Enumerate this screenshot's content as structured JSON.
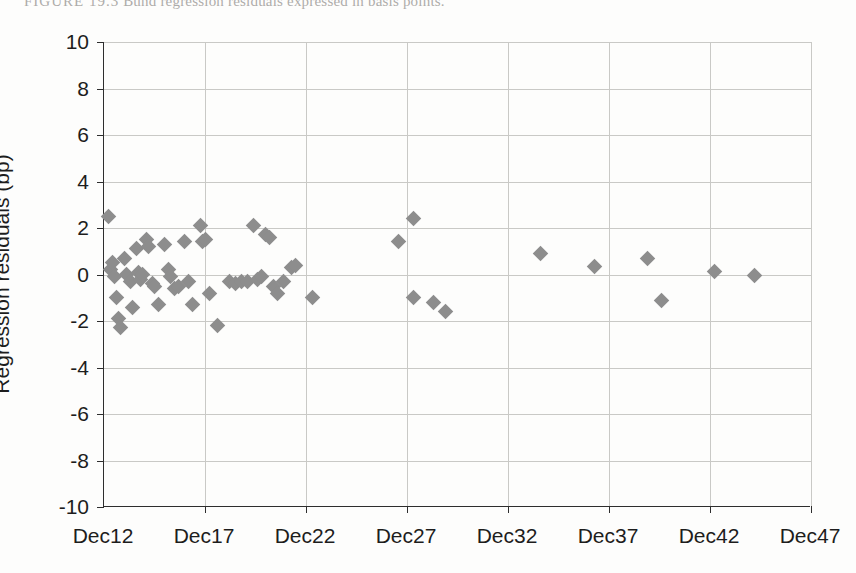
{
  "caption": {
    "label": "FIGURE 19.3",
    "text": "Bund regression residuals expressed in basis points."
  },
  "chart_data": {
    "type": "scatter",
    "title": "",
    "xlabel": "",
    "ylabel": "Regression residuals (bp)",
    "xlim": [
      2012,
      2047
    ],
    "ylim": [
      -10,
      10
    ],
    "grid": true,
    "legend": "none",
    "marker": {
      "shape": "diamond",
      "color": "#8d8d8d",
      "size": 11
    },
    "xtick_labels": [
      "Dec12",
      "Dec17",
      "Dec22",
      "Dec27",
      "Dec32",
      "Dec37",
      "Dec42",
      "Dec47"
    ],
    "xtick_values": [
      2012,
      2017,
      2022,
      2027,
      2032,
      2037,
      2042,
      2047
    ],
    "ytick_labels": [
      "10",
      "8",
      "6",
      "4",
      "2",
      "0",
      "-2",
      "-4",
      "-6",
      "-8",
      "-10"
    ],
    "ytick_values": [
      10,
      8,
      6,
      4,
      2,
      0,
      -2,
      -4,
      -6,
      -8,
      -10
    ],
    "series": [
      {
        "name": "Bund regression residuals",
        "points": [
          [
            2012.2,
            2.5
          ],
          [
            2012.3,
            0.2
          ],
          [
            2012.4,
            0.5
          ],
          [
            2012.5,
            -0.1
          ],
          [
            2012.6,
            -1.0
          ],
          [
            2012.7,
            -1.9
          ],
          [
            2012.8,
            -2.3
          ],
          [
            2013.0,
            0.7
          ],
          [
            2013.1,
            0.0
          ],
          [
            2013.3,
            -0.3
          ],
          [
            2013.4,
            -1.4
          ],
          [
            2013.6,
            1.1
          ],
          [
            2013.7,
            0.1
          ],
          [
            2013.8,
            -0.2
          ],
          [
            2013.9,
            0.0
          ],
          [
            2014.1,
            1.5
          ],
          [
            2014.2,
            1.2
          ],
          [
            2014.4,
            -0.4
          ],
          [
            2014.5,
            -0.5
          ],
          [
            2014.7,
            -1.3
          ],
          [
            2015.0,
            1.3
          ],
          [
            2015.2,
            0.2
          ],
          [
            2015.3,
            -0.1
          ],
          [
            2015.5,
            -0.6
          ],
          [
            2015.7,
            -0.5
          ],
          [
            2016.0,
            1.4
          ],
          [
            2016.2,
            -0.3
          ],
          [
            2016.4,
            -1.3
          ],
          [
            2016.8,
            2.1
          ],
          [
            2016.9,
            1.4
          ],
          [
            2017.0,
            1.5
          ],
          [
            2017.2,
            -0.8
          ],
          [
            2017.6,
            -2.2
          ],
          [
            2018.2,
            -0.3
          ],
          [
            2018.5,
            -0.4
          ],
          [
            2018.8,
            -0.3
          ],
          [
            2019.1,
            -0.3
          ],
          [
            2019.4,
            2.1
          ],
          [
            2019.6,
            -0.2
          ],
          [
            2019.8,
            -0.1
          ],
          [
            2020.0,
            1.7
          ],
          [
            2020.2,
            1.6
          ],
          [
            2020.4,
            -0.5
          ],
          [
            2020.6,
            -0.8
          ],
          [
            2020.9,
            -0.3
          ],
          [
            2021.3,
            0.3
          ],
          [
            2021.5,
            0.4
          ],
          [
            2022.3,
            -1.0
          ],
          [
            2026.6,
            1.4
          ],
          [
            2027.3,
            2.4
          ],
          [
            2027.3,
            -1.0
          ],
          [
            2028.3,
            -1.2
          ],
          [
            2028.9,
            -1.6
          ],
          [
            2033.6,
            0.9
          ],
          [
            2036.3,
            0.35
          ],
          [
            2038.9,
            0.7
          ],
          [
            2039.6,
            -1.1
          ],
          [
            2042.2,
            0.15
          ],
          [
            2044.2,
            -0.05
          ]
        ]
      }
    ]
  }
}
